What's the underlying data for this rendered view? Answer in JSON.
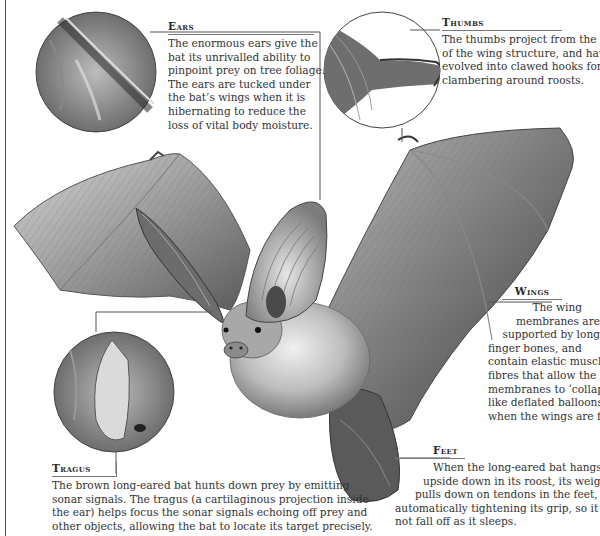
{
  "callouts": {
    "ears": {
      "heading": "Ears",
      "lines": [
        "The enormous ears give the",
        "bat its unrivalled ability to",
        "pinpoint prey on tree foliage.",
        "The ears are tucked under",
        "the bat’s wings when it is",
        "hibernating to reduce the",
        "loss of vital body moisture."
      ]
    },
    "thumbs": {
      "heading": "Thumbs",
      "lines": [
        "The thumbs project from the front",
        "of the wing structure, and have",
        "evolved into clawed hooks for",
        "clambering around roosts."
      ]
    },
    "wings": {
      "heading": "Wings",
      "lines": [
        "The wing",
        "membranes are",
        "supported by long",
        "finger bones, and",
        "contain elastic muscle",
        "fibres that allow the",
        "membranes to ‘collapse’",
        "like deflated balloons",
        "when the wings are folded."
      ]
    },
    "feet": {
      "heading": "Feet",
      "lines": [
        "When the long-eared bat hangs",
        "upside down in its roost, its weight",
        "pulls down on tendons in the feet,",
        "automatically tightening its grip, so it does",
        "not fall off as it sleeps."
      ]
    },
    "tragus": {
      "heading": "Tragus",
      "lines": [
        "The brown long-eared bat hunts down prey by emitting",
        "sonar signals. The tragus (a cartilaginous projection inside",
        "the ear) helps focus the sonar signals echoing off prey and",
        "other objects, allowing the bat to locate its target precisely."
      ]
    }
  },
  "insets": [
    {
      "name": "ear-detail",
      "label": "Ear close-up"
    },
    {
      "name": "thumb-detail",
      "label": "Thumb claw close-up"
    },
    {
      "name": "tragus-detail",
      "label": "Tragus close-up"
    }
  ],
  "colors": {
    "background": "#ffffff",
    "text": "#333333",
    "rule": "#555555",
    "illustration_dark": "#3a3a3a",
    "illustration_mid": "#8a8a8a",
    "illustration_light": "#c9c9c9"
  }
}
